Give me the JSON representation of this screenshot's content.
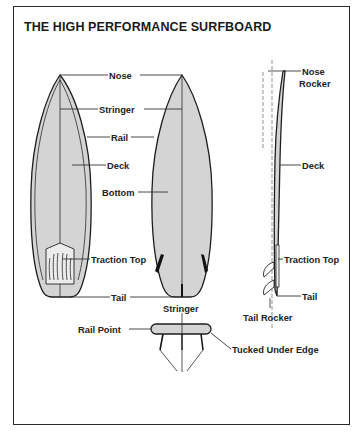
{
  "title": "THE HIGH PERFORMANCE SURFBOARD",
  "colors": {
    "board_fill": "#d4d4d4",
    "outline": "#1e1e1e",
    "text": "#222222",
    "frame": "#2a2a2a"
  },
  "deck_view": {
    "labels": {
      "nose": "Nose",
      "stringer": "Stringer",
      "rail": "Rail",
      "deck": "Deck",
      "traction_top": "Traction Top",
      "tail": "Tail"
    }
  },
  "bottom_view": {
    "labels": {
      "bottom": "Bottom"
    }
  },
  "side_view": {
    "labels": {
      "nose_rocker_1": "Nose",
      "nose_rocker_2": "Rocker",
      "deck": "Deck",
      "traction_top": "Traction Top",
      "tail": "Tail",
      "tail_rocker": "Tail Rocker"
    }
  },
  "cross_section": {
    "labels": {
      "stringer": "Stringer",
      "rail_point": "Rail Point",
      "tucked_under_edge": "Tucked Under Edge"
    }
  }
}
